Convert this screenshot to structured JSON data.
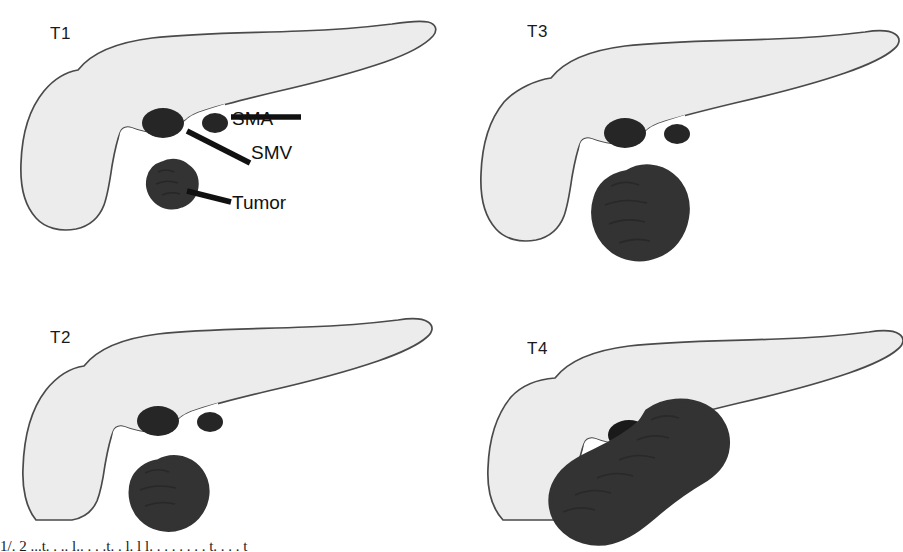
{
  "figure": {
    "colors": {
      "pancreas_fill": "#ececec",
      "pancreas_stroke": "#4a4a4a",
      "tumor_fill": "#333333",
      "vessel_fill": "#262626",
      "leader_line": "#111111",
      "background": "#ffffff"
    }
  },
  "panels": [
    {
      "id": "t1",
      "label": "T1",
      "label_x": 50,
      "label_y": 24,
      "tumor_size": "small",
      "tumor_confined": true,
      "has_callouts": true
    },
    {
      "id": "t3",
      "label": "T3",
      "label_x": 527,
      "label_y": 22,
      "tumor_size": "large",
      "tumor_confined": false,
      "has_callouts": false
    },
    {
      "id": "t2",
      "label": "T2",
      "label_x": 50,
      "label_y": 328,
      "tumor_size": "medium",
      "tumor_confined": true,
      "has_callouts": false
    },
    {
      "id": "t4",
      "label": "T4",
      "label_x": 527,
      "label_y": 339,
      "tumor_size": "encasing",
      "tumor_confined": false,
      "has_callouts": false
    }
  ],
  "callouts": [
    {
      "id": "sma",
      "label": "SMA",
      "x": 232,
      "y": 112
    },
    {
      "id": "smv",
      "label": "SMV",
      "x": 251,
      "y": 146
    },
    {
      "id": "tumor",
      "label": "Tumor",
      "x": 232,
      "y": 196
    }
  ],
  "caption": {
    "text": "1/. 2 ...t. . .. l.. . . .t. . l. l l. . . . . . . . t. . . . t"
  }
}
